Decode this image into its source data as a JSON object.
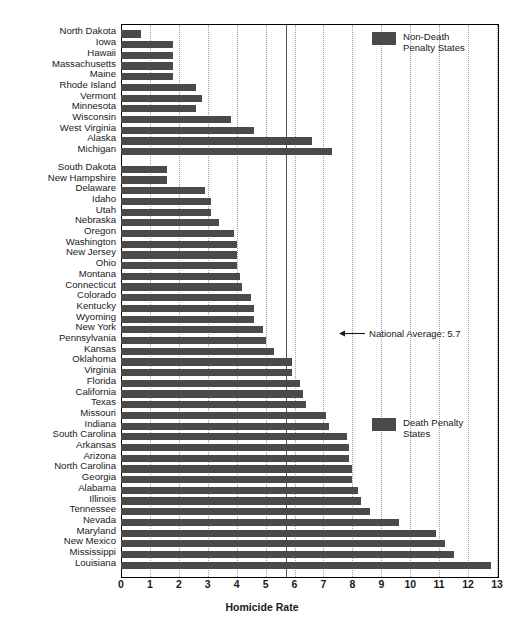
{
  "chart_data": {
    "type": "bar",
    "orientation": "horizontal",
    "title": "",
    "xlabel": "Homicide Rate",
    "ylabel": "",
    "xlim": [
      0,
      13
    ],
    "xticks": [
      0,
      1,
      2,
      3,
      4,
      5,
      6,
      7,
      8,
      9,
      10,
      11,
      12,
      13
    ],
    "xtick_labels": [
      "0",
      "1",
      "2",
      "3",
      "4",
      "5",
      "6",
      "7",
      "8",
      "9",
      "10",
      "11",
      "12",
      "13"
    ],
    "grid": "vertical-dotted",
    "bar_color": "#4a4a4a",
    "legend_position": "inside-right",
    "categories": [
      "North Dakota",
      "Iowa",
      "Hawaii",
      "Massachusetts",
      "Maine",
      "Rhode Island",
      "Vermont",
      "Minnesota",
      "Wisconsin",
      "West Virginia",
      "Alaska",
      "Michigan",
      "South Dakota",
      "New Hampshire",
      "Delaware",
      "Idaho",
      "Utah",
      "Nebraska",
      "Oregon",
      "Washington",
      "New Jersey",
      "Ohio",
      "Montana",
      "Connecticut",
      "Colorado",
      "Kentucky",
      "Wyoming",
      "New York",
      "Pennsylvania",
      "Kansas",
      "Oklahoma",
      "Virginia",
      "Florida",
      "California",
      "Texas",
      "Missouri",
      "Indiana",
      "South Carolina",
      "Arkansas",
      "Arizona",
      "North Carolina",
      "Georgia",
      "Alabama",
      "Illinois",
      "Tennessee",
      "Nevada",
      "Maryland",
      "New Mexico",
      "Mississippi",
      "Louisiana"
    ],
    "values": [
      0.7,
      1.8,
      1.8,
      1.8,
      1.8,
      2.6,
      2.8,
      2.6,
      3.8,
      4.6,
      6.6,
      7.3,
      1.6,
      1.6,
      2.9,
      3.1,
      3.1,
      3.4,
      3.9,
      4.0,
      4.0,
      4.0,
      4.1,
      4.2,
      4.5,
      4.6,
      4.6,
      4.9,
      5.0,
      5.3,
      5.9,
      5.9,
      6.2,
      6.3,
      6.4,
      7.1,
      7.2,
      7.8,
      7.9,
      7.9,
      8.0,
      8.0,
      8.2,
      8.3,
      8.6,
      9.6,
      10.9,
      11.2,
      11.5,
      12.8
    ],
    "groups": [
      {
        "name": "Non-Death Penalty States",
        "legend_label": "Non-Death\nPenalty States",
        "color": "#4a4a4a",
        "start_index": 0,
        "count": 12
      },
      {
        "name": "Death Penalty States",
        "legend_label": "Death Penalty\nStates",
        "color": "#4a4a4a",
        "start_index": 12,
        "count": 38
      }
    ],
    "annotations": [
      {
        "label": "National Average: 5.7",
        "value": 5.7,
        "type": "vertical-reference-line",
        "arrow": "left"
      }
    ]
  }
}
